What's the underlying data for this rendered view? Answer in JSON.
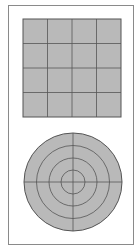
{
  "diagram": {
    "grid": {
      "rows": 4,
      "cols": 4,
      "fill": "#b9b9b9",
      "line": "#555555"
    },
    "polar": {
      "rings": 4,
      "spokes": 2,
      "fill": "#b9b9b9",
      "line": "#555555"
    },
    "frame_color": "#8a8a8a"
  }
}
